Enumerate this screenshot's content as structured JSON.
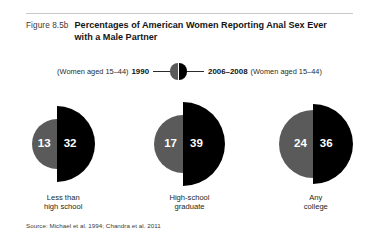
{
  "figure": {
    "number": "Figure 8.5b",
    "title": "Percentages of American Women Reporting Anal Sex Ever with a Male Partner",
    "source": "Source: Michael et al. 1994; Chandra et al. 2011"
  },
  "legend": {
    "left_note": "(Women aged 15–44)",
    "left_year": "1990",
    "right_year": "2006–2008",
    "right_note": "(Women aged 15–44)",
    "left_color": "#5a5a5a",
    "right_color": "#000000"
  },
  "chart_data": {
    "type": "bar",
    "title": "Percentages of American Women Reporting Anal Sex Ever with a Male Partner",
    "subtitle": "",
    "xlabel": "",
    "ylabel": "Percent",
    "categories": [
      "Less than high school",
      "High-school graduate",
      "Any college"
    ],
    "category_lines": [
      [
        "Less than",
        "high school"
      ],
      [
        "High-school",
        "graduate"
      ],
      [
        "Any",
        "college"
      ]
    ],
    "series": [
      {
        "name": "1990",
        "values": [
          13,
          17,
          24
        ],
        "color": "#5a5a5a"
      },
      {
        "name": "2006–2008",
        "values": [
          32,
          39,
          36
        ],
        "color": "#000000"
      }
    ],
    "value_labels": [
      {
        "left": "13",
        "right": "32"
      },
      {
        "left": "17",
        "right": "39"
      },
      {
        "left": "24",
        "right": "36"
      }
    ],
    "legend_position": "top-center",
    "grid": false,
    "note": "Each pair drawn as two half-circles whose radii scale with the value."
  },
  "geometry": {
    "radii_px": [
      {
        "left": 25,
        "right": 38
      },
      {
        "left": 29,
        "right": 42
      },
      {
        "left": 34,
        "right": 40
      }
    ]
  }
}
